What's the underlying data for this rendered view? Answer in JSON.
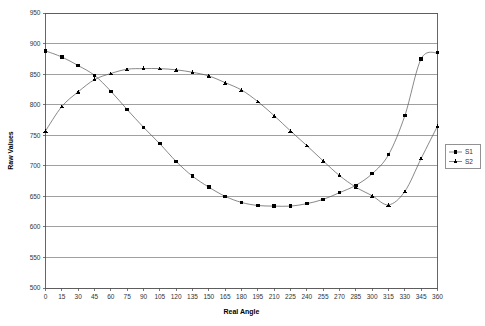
{
  "chart_data": {
    "type": "line",
    "title": "",
    "xlabel": "Real Angle",
    "ylabel": "Raw Values",
    "xlim": [
      0,
      360
    ],
    "ylim": [
      500,
      950
    ],
    "ytick_step": 50,
    "xtick_step": 15,
    "grid": "horizontal",
    "legend_position": "right",
    "xticks": [
      "0",
      "15",
      "30",
      "45",
      "60",
      "75",
      "90",
      "105",
      "120",
      "135",
      "150",
      "165",
      "180",
      "195",
      "210",
      "225",
      "240",
      "255",
      "270",
      "285",
      "300",
      "315",
      "330",
      "345",
      "360"
    ],
    "yticks": [
      "500",
      "550",
      "600",
      "650",
      "700",
      "750",
      "800",
      "850",
      "900",
      "950"
    ],
    "x": [
      0,
      15,
      30,
      45,
      60,
      75,
      90,
      105,
      120,
      135,
      150,
      165,
      180,
      195,
      210,
      225,
      240,
      255,
      270,
      285,
      300,
      315,
      330,
      345,
      360
    ],
    "series": [
      {
        "name": "S1",
        "marker": "square",
        "values": [
          888,
          878,
          864,
          848,
          822,
          792,
          763,
          736,
          707,
          683,
          665,
          650,
          640,
          635,
          634,
          634,
          638,
          645,
          656,
          668,
          687,
          718,
          782,
          875,
          885
        ]
      },
      {
        "name": "S2",
        "marker": "triangle",
        "values": [
          757,
          797,
          821,
          841,
          851,
          858,
          859,
          859,
          857,
          853,
          847,
          836,
          824,
          805,
          782,
          757,
          733,
          708,
          684,
          665,
          651,
          636,
          658,
          712,
          765
        ]
      }
    ]
  },
  "legend": {
    "entries": [
      {
        "label": "S1"
      },
      {
        "label": "S2"
      }
    ]
  }
}
